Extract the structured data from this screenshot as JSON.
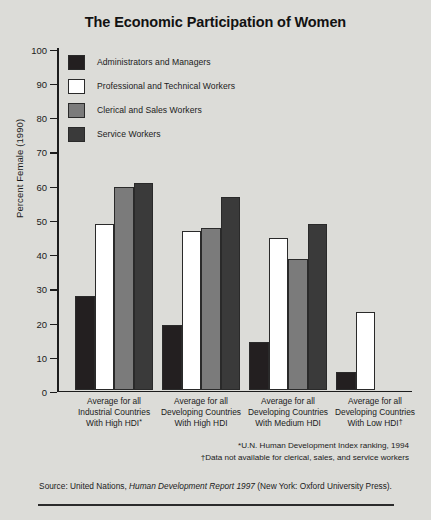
{
  "figure": {
    "title": "The Economic Participation of Women",
    "background_color": "#dcdcd8",
    "axis_color": "#1c1c1c"
  },
  "footnotes": [
    "*U.N. Human Development Index ranking, 1994",
    "†Data not available for clerical, sales, and service workers"
  ],
  "source": {
    "prefix": "Source: United Nations, ",
    "italic": "Human Development Report 1997",
    "suffix": " (New York: Oxford University Press)."
  },
  "chart_data": {
    "type": "bar",
    "title": "The Economic Participation of Women",
    "xlabel": "",
    "ylabel": "Percent Female (1990)",
    "ylim": [
      0,
      100
    ],
    "yticks": [
      0,
      10,
      20,
      30,
      40,
      50,
      60,
      70,
      80,
      90,
      100
    ],
    "ytick_labels": [
      "0",
      "10",
      "20",
      "30",
      "40",
      "50",
      "60",
      "70",
      "80",
      "90",
      "100"
    ],
    "grid": false,
    "legend_position": "upper-left-inside",
    "categories": [
      "Average for all Industrial Countries With High HDI*",
      "Average for all Developing Countries With High HDI",
      "Average for all Developing Countries With Medium HDI",
      "Average for all Developing Countries With Low HDI†"
    ],
    "category_lines": [
      [
        "Average for all",
        "Industrial Countries",
        "With High HDI*"
      ],
      [
        "Average for all",
        "Developing Countries",
        "With High HDI"
      ],
      [
        "Average for all",
        "Developing Countries",
        "With Medium HDI"
      ],
      [
        "Average for all",
        "Developing Countries",
        "With Low HDI†"
      ]
    ],
    "series": [
      {
        "name": "Administrators and Managers",
        "color": "#231f20",
        "values": [
          27.5,
          19,
          14,
          5.5
        ]
      },
      {
        "name": "Professional and Technical Workers",
        "color": "#ffffff",
        "values": [
          48.5,
          46.5,
          44.5,
          23
        ]
      },
      {
        "name": "Clerical and Sales Workers",
        "color": "#7b7b7b",
        "values": [
          59.5,
          47.5,
          38.5,
          null
        ]
      },
      {
        "name": "Service Workers",
        "color": "#3a3a3a",
        "values": [
          60.5,
          56.5,
          48.5,
          null
        ]
      }
    ]
  }
}
